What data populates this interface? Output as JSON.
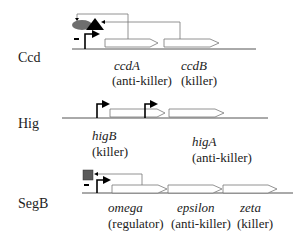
{
  "operons": [
    {
      "name": "Ccd",
      "genes": [
        {
          "name": "ccdA",
          "role": "(anti-killer)"
        },
        {
          "name": "ccdB",
          "role": "(killer)"
        }
      ],
      "repression_mark": "-"
    },
    {
      "name": "Hig",
      "genes": [
        {
          "name": "higB",
          "role": "(killer)"
        },
        {
          "name": "higA",
          "role": "(anti-killer)"
        }
      ]
    },
    {
      "name": "SegB",
      "genes": [
        {
          "name": "omega",
          "role": "(regulator)"
        },
        {
          "name": "epsilon",
          "role": "(anti-killer)"
        },
        {
          "name": "zeta",
          "role": "(killer)"
        }
      ],
      "repression_mark": "-"
    }
  ],
  "colors": {
    "line": "#555555",
    "arrow_fill": "#000000",
    "repressor_oval": "#6e6e6e",
    "repressor_square": "#5a5a5a"
  }
}
